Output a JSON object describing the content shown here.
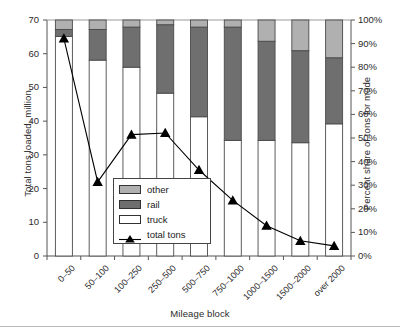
{
  "chart_data": {
    "type": "bar",
    "subtype": "stacked-bar-with-line-overlay",
    "title": "",
    "xlabel": "Mileage block",
    "ylabel": "Total tons loaded, million",
    "y2label": "Percent share of tons for mode",
    "categories": [
      "0–50",
      "50–100",
      "100–250",
      "250–500",
      "500–750",
      "750–1000",
      "1000–1500",
      "1500–2000",
      "over 2000"
    ],
    "ylim": [
      0,
      70
    ],
    "yticks": [
      0,
      10,
      20,
      30,
      40,
      50,
      60,
      70
    ],
    "yticklabels": [
      "0",
      "10",
      "20",
      "30",
      "40",
      "50",
      "60",
      "70"
    ],
    "y2lim": [
      0,
      100
    ],
    "y2ticks": [
      0,
      10,
      20,
      30,
      40,
      50,
      60,
      70,
      80,
      90,
      100
    ],
    "y2ticklabels": [
      "0%",
      "10%",
      "20%",
      "30%",
      "40%",
      "50%",
      "60%",
      "70%",
      "80%",
      "90%",
      "100%"
    ],
    "grid": false,
    "legend_position": "center-left-inside",
    "series": [
      {
        "name": "truck",
        "axis": "right",
        "unit": "percent",
        "color": "#ffffff",
        "values": [
          93,
          83,
          80,
          69,
          59,
          49,
          49,
          48,
          56
        ]
      },
      {
        "name": "rail",
        "axis": "right",
        "unit": "percent",
        "color": "#6f6f6f",
        "values": [
          3,
          13,
          17,
          29,
          38,
          48,
          42,
          39,
          28
        ]
      },
      {
        "name": "other",
        "axis": "right",
        "unit": "percent",
        "color": "#b0b0b0",
        "values": [
          4,
          4,
          3,
          2,
          3,
          3,
          9,
          13,
          16
        ]
      },
      {
        "name": "total tons",
        "axis": "left",
        "unit": "million tons",
        "color": "#000000",
        "marker": "triangle",
        "values": [
          64.5,
          22.0,
          36.0,
          36.5,
          25.5,
          16.5,
          9.0,
          4.5,
          3.0
        ]
      }
    ]
  },
  "legend": {
    "items": [
      {
        "label": "other",
        "kind": "swatch",
        "color": "#b0b0b0"
      },
      {
        "label": "rail",
        "kind": "swatch",
        "color": "#6f6f6f"
      },
      {
        "label": "truck",
        "kind": "swatch",
        "color": "#ffffff"
      },
      {
        "label": "total tons",
        "kind": "line-marker",
        "color": "#000000"
      }
    ]
  },
  "colors": {
    "other": "#b0b0b0",
    "rail": "#6f6f6f",
    "truck": "#ffffff",
    "line": "#000000",
    "axis": "#555555",
    "text": "#2b2b2b"
  }
}
